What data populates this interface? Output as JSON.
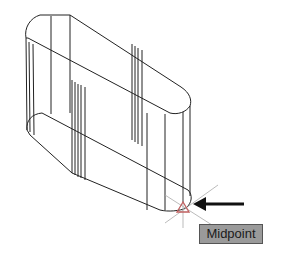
{
  "viewport": {
    "object": "extruded-slot-wireframe",
    "background_color": "#ffffff",
    "line_color": "#222222"
  },
  "osnap": {
    "marker": "midpoint-triangle",
    "tooltip_label": "Midpoint",
    "tooltip_bg": "#9a9a9a",
    "marker_color": "#c06060"
  },
  "annotation": {
    "arrow": "left-pointing-arrow"
  }
}
